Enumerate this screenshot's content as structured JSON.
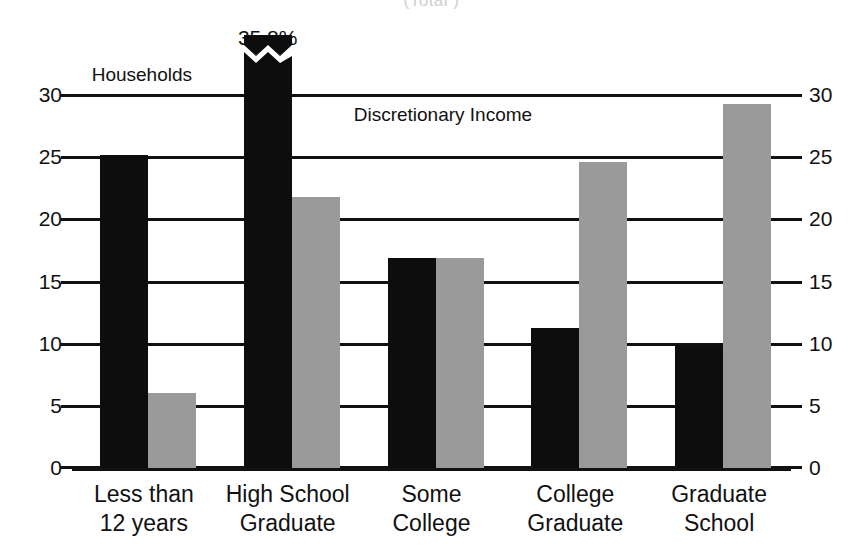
{
  "chart_data": {
    "type": "bar",
    "title": "",
    "subtitle_cropped": "(Total      )",
    "xlabel": "",
    "ylabel": "",
    "ylim": [
      0,
      30
    ],
    "yticks": [
      0,
      5,
      10,
      15,
      20,
      25,
      30
    ],
    "ytick_labels": [
      "0",
      "5",
      "10",
      "15",
      "20",
      "25",
      "30"
    ],
    "grid": true,
    "dual_axis": true,
    "legend_position": "inline-annotations",
    "categories": [
      "Less than 12 years",
      "High School Graduate",
      "Some College",
      "College Graduate",
      "Graduate School"
    ],
    "category_lines": [
      [
        "Less than",
        "12 years"
      ],
      [
        "High School",
        "Graduate"
      ],
      [
        "Some",
        "College"
      ],
      [
        "College",
        "Graduate"
      ],
      [
        "Graduate",
        "School"
      ]
    ],
    "series": [
      {
        "name": "Households",
        "color": "#0d0d0d",
        "values": [
          25.2,
          35.8,
          16.9,
          11.3,
          9.9
        ],
        "truncated_index": 1,
        "truncated_note": "bar broken with zigzag axis break; true value 35.8%"
      },
      {
        "name": "Discretionary Income",
        "color": "#9a9a9a",
        "values": [
          6.0,
          21.8,
          16.9,
          24.6,
          29.3
        ]
      }
    ],
    "annotations": [
      {
        "text": "35.8%",
        "target": "Households / High School Graduate"
      },
      {
        "text": "Households",
        "target": "series-1 label"
      },
      {
        "text": "Discretionary Income",
        "target": "series-2 label"
      }
    ]
  },
  "axis": {
    "left_labels": [
      "30",
      "25",
      "20",
      "15",
      "10",
      "5",
      "0"
    ],
    "right_labels": [
      "30",
      "25",
      "20",
      "15",
      "10",
      "5",
      "0"
    ]
  },
  "annotations": {
    "peak_value": "35.8%",
    "series_one": "Households",
    "series_two_line1": "Discretionary",
    "series_two_line2": "Income"
  }
}
